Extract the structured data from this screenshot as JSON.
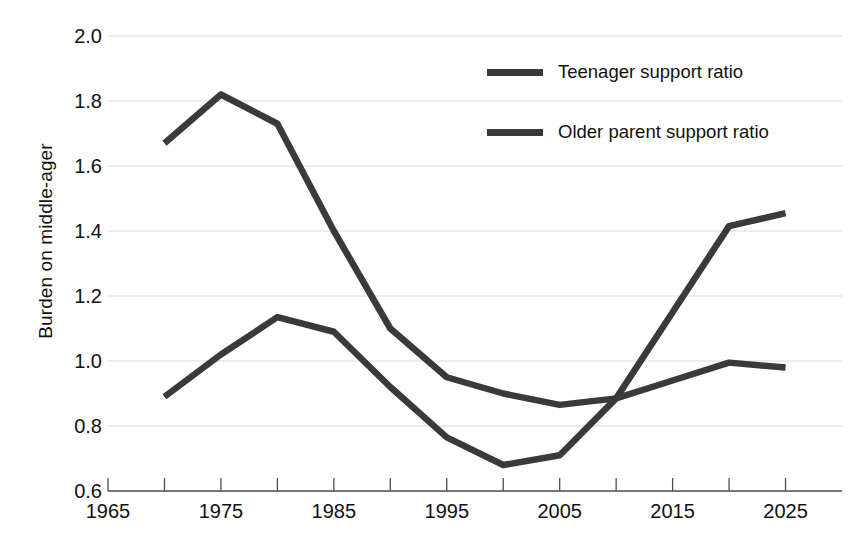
{
  "chart_data": {
    "type": "line",
    "title": "",
    "xlabel": "",
    "ylabel": "Burden on middle-ager",
    "xlim": [
      1965,
      2030
    ],
    "ylim": [
      0.6,
      2.0
    ],
    "grid": true,
    "legend_position": "top-right",
    "x_ticks": [
      1965,
      1975,
      1985,
      1995,
      2005,
      2015,
      2025
    ],
    "x_minor_ticks": [
      1970,
      1980,
      1990,
      2000,
      2010,
      2020
    ],
    "y_ticks": [
      0.6,
      0.8,
      1.0,
      1.2,
      1.4,
      1.6,
      1.8,
      2.0
    ],
    "x": [
      1970,
      1975,
      1980,
      1985,
      1990,
      1995,
      2000,
      2005,
      2010,
      2015,
      2020,
      2025
    ],
    "series": [
      {
        "name": "Teenager support ratio",
        "color": "#3a3a3a",
        "values": [
          1.67,
          1.82,
          1.73,
          1.4,
          1.1,
          0.95,
          0.9,
          0.865,
          0.885,
          1.15,
          1.415,
          1.455
        ]
      },
      {
        "name": "Older parent support ratio",
        "color": "#3a3a3a",
        "values": [
          0.89,
          1.02,
          1.135,
          1.09,
          0.92,
          0.765,
          0.68,
          0.71,
          0.885,
          0.94,
          0.995,
          0.98
        ]
      }
    ]
  },
  "axis": {
    "y_label": "Burden on middle-ager",
    "y_tick_labels": [
      "2.0",
      "1.8",
      "1.6",
      "1.4",
      "1.2",
      "1.0",
      "0.8",
      "0.6"
    ],
    "x_tick_labels": [
      "1965",
      "1975",
      "1985",
      "1995",
      "2005",
      "2015",
      "2025"
    ]
  },
  "legend": {
    "items": [
      {
        "label": "Teenager support ratio",
        "color": "#3a3a3a"
      },
      {
        "label": "Older parent support ratio",
        "color": "#3a3a3a"
      }
    ]
  },
  "colors": {
    "line": "#3a3a3a",
    "grid": "#d9d9d9",
    "axis": "#4d4d4d",
    "text": "#111111",
    "background": "#ffffff"
  }
}
